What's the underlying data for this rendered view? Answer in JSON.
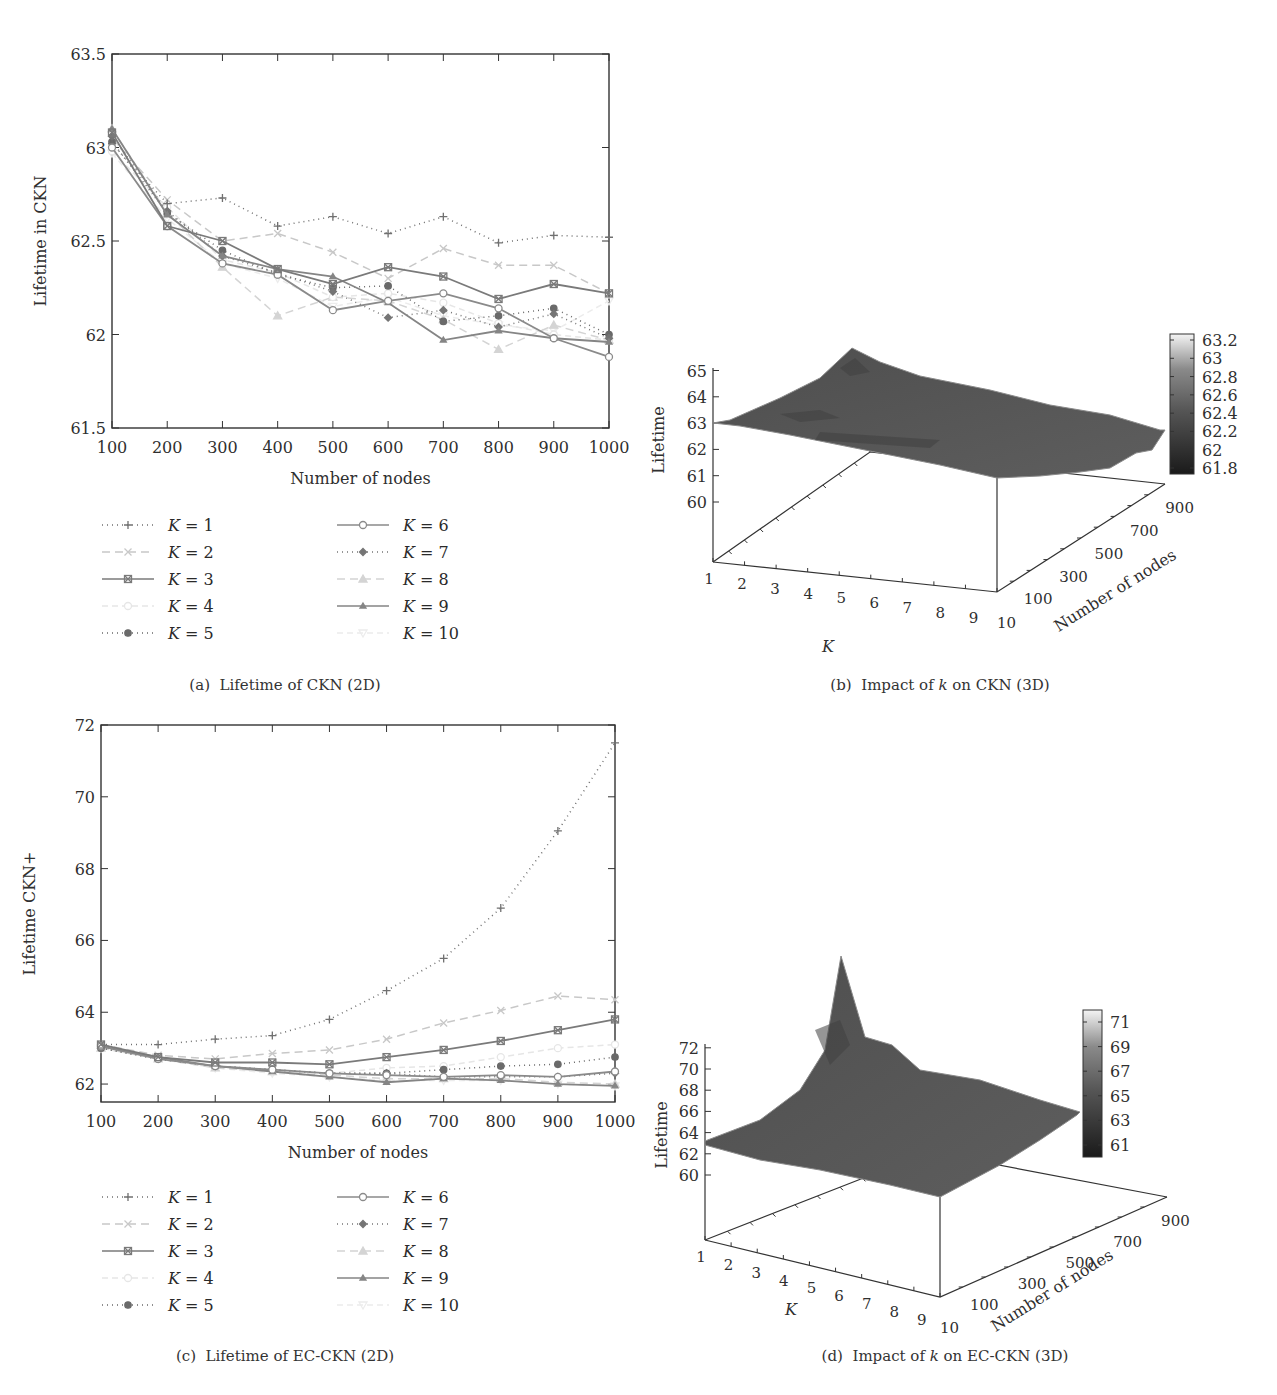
{
  "chart_data": [
    {
      "id": "a",
      "type": "line",
      "title": "(a) Lifetime of CKN (2D)",
      "xlabel": "Number of nodes",
      "ylabel": "Lifetime in CKN",
      "x": [
        100,
        200,
        300,
        400,
        500,
        600,
        700,
        800,
        900,
        1000
      ],
      "xticks": [
        "100",
        "200",
        "300",
        "400",
        "500",
        "600",
        "700",
        "800",
        "900",
        "1000"
      ],
      "yticks": [
        "61.5",
        "62",
        "62.5",
        "63",
        "63.5"
      ],
      "ylim": [
        61.5,
        63.5
      ],
      "grid": false,
      "legend_position": "below",
      "series": [
        {
          "name": "K = 1",
          "values": [
            63.02,
            62.7,
            62.73,
            62.58,
            62.63,
            62.54,
            62.63,
            62.49,
            62.53,
            62.52
          ]
        },
        {
          "name": "K = 2",
          "values": [
            63.05,
            62.72,
            62.5,
            62.54,
            62.44,
            62.3,
            62.46,
            62.37,
            62.37,
            62.22
          ]
        },
        {
          "name": "K = 3",
          "values": [
            63.08,
            62.58,
            62.5,
            62.35,
            62.27,
            62.36,
            62.31,
            62.19,
            62.27,
            62.22
          ]
        },
        {
          "name": "K = 4",
          "values": [
            62.98,
            62.68,
            62.4,
            62.33,
            62.2,
            62.22,
            62.17,
            62.06,
            62.0,
            61.97
          ]
        },
        {
          "name": "K = 5",
          "values": [
            63.03,
            62.65,
            62.45,
            62.32,
            62.25,
            62.26,
            62.07,
            62.1,
            62.14,
            62.0
          ]
        },
        {
          "name": "K = 6",
          "values": [
            63.0,
            62.58,
            62.38,
            62.32,
            62.13,
            62.18,
            62.22,
            62.14,
            61.98,
            61.88
          ]
        },
        {
          "name": "K = 7",
          "values": [
            63.06,
            62.66,
            62.42,
            62.33,
            62.23,
            62.09,
            62.13,
            62.04,
            62.11,
            61.98
          ]
        },
        {
          "name": "K = 8",
          "values": [
            63.1,
            62.65,
            62.36,
            62.1,
            62.2,
            62.18,
            62.08,
            61.92,
            62.05,
            61.97
          ]
        },
        {
          "name": "K = 9",
          "values": [
            63.1,
            62.64,
            62.42,
            62.35,
            62.31,
            62.17,
            61.97,
            62.02,
            61.98,
            61.96
          ]
        },
        {
          "name": "K = 10",
          "values": [
            62.97,
            62.62,
            62.38,
            62.3,
            62.15,
            62.2,
            62.1,
            62.05,
            62.02,
            62.18
          ]
        }
      ]
    },
    {
      "id": "b",
      "type": "surface3d",
      "title": "(b) Impact of k on CKN (3D)",
      "xlabel": "K",
      "ylabel": "Number of nodes",
      "zlabel": "Lifetime",
      "xticks": [
        "1",
        "2",
        "3",
        "4",
        "5",
        "6",
        "7",
        "8",
        "9",
        "10"
      ],
      "yticks": [
        "100",
        "300",
        "500",
        "700",
        "900"
      ],
      "zticks": [
        "60",
        "61",
        "62",
        "63",
        "64",
        "65"
      ],
      "colorbar_ticks": [
        "63.2",
        "63",
        "62.8",
        "62.6",
        "62.4",
        "62.2",
        "62",
        "61.8"
      ],
      "colorbar_range": [
        61.8,
        63.2
      ]
    },
    {
      "id": "c",
      "type": "line",
      "title": "(c) Lifetime of EC-CKN (2D)",
      "xlabel": "Number of nodes",
      "ylabel": "Lifetime CKN+",
      "x": [
        100,
        200,
        300,
        400,
        500,
        600,
        700,
        800,
        900,
        1000
      ],
      "xticks": [
        "100",
        "200",
        "300",
        "400",
        "500",
        "600",
        "700",
        "800",
        "900",
        "1000"
      ],
      "yticks": [
        "62",
        "64",
        "66",
        "68",
        "70",
        "72"
      ],
      "ylim": [
        61.5,
        72
      ],
      "grid": false,
      "legend_position": "below",
      "series": [
        {
          "name": "K = 1",
          "values": [
            63.1,
            63.1,
            63.25,
            63.35,
            63.8,
            64.6,
            65.5,
            66.9,
            69.05,
            71.5
          ]
        },
        {
          "name": "K = 2",
          "values": [
            63.1,
            62.8,
            62.7,
            62.85,
            62.95,
            63.25,
            63.7,
            64.05,
            64.45,
            64.35
          ]
        },
        {
          "name": "K = 3",
          "values": [
            63.1,
            62.75,
            62.6,
            62.6,
            62.55,
            62.75,
            62.95,
            63.2,
            63.5,
            63.8
          ]
        },
        {
          "name": "K = 4",
          "values": [
            63.0,
            62.7,
            62.5,
            62.35,
            62.3,
            62.45,
            62.5,
            62.75,
            63.0,
            63.1
          ]
        },
        {
          "name": "K = 5",
          "values": [
            63.0,
            62.7,
            62.5,
            62.4,
            62.3,
            62.3,
            62.4,
            62.5,
            62.55,
            62.75
          ]
        },
        {
          "name": "K = 6",
          "values": [
            63.05,
            62.7,
            62.5,
            62.4,
            62.3,
            62.25,
            62.2,
            62.25,
            62.2,
            62.35
          ]
        },
        {
          "name": "K = 7",
          "values": [
            63.0,
            62.7,
            62.5,
            62.4,
            62.3,
            62.3,
            62.2,
            62.2,
            62.2,
            62.3
          ]
        },
        {
          "name": "K = 8",
          "values": [
            63.0,
            62.7,
            62.45,
            62.35,
            62.25,
            62.15,
            62.15,
            62.15,
            62.05,
            62.0
          ]
        },
        {
          "name": "K = 9",
          "values": [
            63.05,
            62.75,
            62.5,
            62.35,
            62.2,
            62.05,
            62.15,
            62.1,
            62.0,
            61.95
          ]
        },
        {
          "name": "K = 10",
          "values": [
            63.0,
            62.7,
            62.45,
            62.3,
            62.2,
            62.1,
            62.1,
            62.1,
            62.0,
            61.95
          ]
        }
      ]
    },
    {
      "id": "d",
      "type": "surface3d",
      "title": "(d) Impact of k on EC-CKN (3D)",
      "xlabel": "K",
      "ylabel": "Number of nodes",
      "zlabel": "Lifetime",
      "xticks": [
        "1",
        "2",
        "3",
        "4",
        "5",
        "6",
        "7",
        "8",
        "9",
        "10"
      ],
      "yticks": [
        "100",
        "300",
        "500",
        "700",
        "900"
      ],
      "zticks": [
        "60",
        "62",
        "64",
        "66",
        "68",
        "70",
        "72"
      ],
      "colorbar_ticks": [
        "71",
        "69",
        "67",
        "65",
        "63",
        "61"
      ],
      "colorbar_range": [
        61,
        72
      ]
    }
  ],
  "captions": {
    "a_prefix": "(a)",
    "a_text": "Lifetime of CKN (2D)",
    "b_prefix": "(b)",
    "b_text_1": "Impact of ",
    "b_k": "k",
    "b_text_2": " on CKN (3D)",
    "c_prefix": "(c)",
    "c_text": "Lifetime of EC-CKN (2D)",
    "d_prefix": "(d)",
    "d_text_1": "Impact of ",
    "d_k": "k",
    "d_text_2": " on EC-CKN (3D)"
  },
  "styles": {
    "series_colors": [
      "#707070",
      "#c8c8c8",
      "#7a7a7a",
      "#e6e6e6",
      "#6a6a6a",
      "#8a8a8a",
      "#757575",
      "#d4d4d4",
      "#858585",
      "#ececec"
    ],
    "series_dash": [
      "1,4",
      "8,5",
      "",
      "6,4",
      "1,4",
      "",
      "1,4",
      "8,5",
      "",
      "6,4"
    ],
    "series_marker": [
      "plus",
      "x",
      "xsquare",
      "circle-open",
      "circle",
      "circle-open",
      "diamond",
      "triangle",
      "tri-small",
      "tri-down"
    ],
    "surface_color": "#5a5a5a",
    "axis_color": "#333333"
  }
}
